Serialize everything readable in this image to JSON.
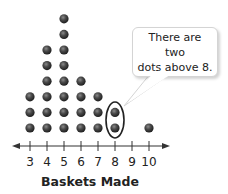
{
  "chart_data": {
    "type": "dot_plot",
    "title": "",
    "xlabel": "Baskets Made",
    "ylabel": "",
    "categories": [
      "3",
      "4",
      "5",
      "6",
      "7",
      "8",
      "9",
      "10"
    ],
    "x": [
      3,
      4,
      5,
      6,
      7,
      8,
      9,
      10
    ],
    "values": [
      3,
      6,
      8,
      4,
      3,
      2,
      0,
      1
    ],
    "xlim": [
      3,
      10
    ],
    "grid": false,
    "legend": null,
    "annotations": [
      {
        "text": "There are two dots above 8.",
        "target_x": 8,
        "shape": "ellipse-highlight"
      }
    ]
  },
  "callout": {
    "line1": "There are two",
    "line2": "dots above 8."
  },
  "axis": {
    "title": "Baskets Made",
    "ticks": [
      "3",
      "4",
      "5",
      "6",
      "7",
      "8",
      "9",
      "10"
    ]
  },
  "colors": {
    "dot": "#3a3a3a",
    "axis": "#333333",
    "highlight": "#222222"
  }
}
